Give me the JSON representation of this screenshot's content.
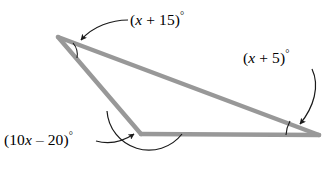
{
  "figure": {
    "type": "triangle-angle-diagram",
    "colors": {
      "triangle_stroke": "#989898",
      "arc_stroke": "#1a1a1a",
      "leader_stroke": "#1a1a1a",
      "label_text": "#000000",
      "background": "#ffffff"
    },
    "vertices": {
      "apex": {
        "x": 58,
        "y": 37
      },
      "bottom_left": {
        "x": 141,
        "y": 134
      },
      "bottom_right": {
        "x": 319,
        "y": 135
      }
    },
    "angles": [
      {
        "id": "apex",
        "label_prefix": "(",
        "variable": "x",
        "operator": " + ",
        "constant": "15",
        "label_suffix": ")",
        "degree_symbol": "°",
        "full_label": "(x + 15)°",
        "position": "top"
      },
      {
        "id": "bottom-right",
        "label_prefix": "(",
        "variable": "x",
        "operator": " + ",
        "constant": "5",
        "label_suffix": ")",
        "degree_symbol": "°",
        "full_label": "(x + 5)°",
        "position": "right"
      },
      {
        "id": "bottom-left",
        "label_prefix": "(10",
        "variable": "x",
        "operator": " – ",
        "constant": "20",
        "label_suffix": ")",
        "degree_symbol": "°",
        "full_label": "(10x – 20)°",
        "position": "bottom-left"
      }
    ]
  }
}
